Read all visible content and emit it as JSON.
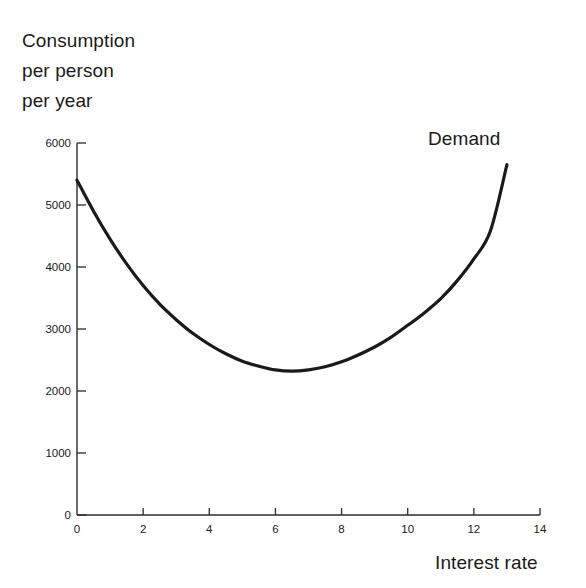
{
  "chart_data": {
    "type": "line",
    "title": "",
    "xlabel": "Interest rate",
    "ylabel": "Consumption per person per year",
    "ylabel_lines": [
      "Consumption",
      "per person",
      "per year"
    ],
    "xlim": [
      0,
      14
    ],
    "ylim": [
      0,
      6000
    ],
    "xticks": [
      0,
      2,
      4,
      6,
      8,
      10,
      12,
      14
    ],
    "xticklabels": [
      "0",
      "2",
      "4",
      "6",
      "8",
      "10",
      "12",
      "14"
    ],
    "yticks": [
      0,
      1000,
      2000,
      3000,
      4000,
      5000,
      6000
    ],
    "yticklabels": [
      "0",
      "1000",
      "2000",
      "3000",
      "4000",
      "5000",
      "6000"
    ],
    "grid": false,
    "legend_position": "inline-right-top",
    "series": [
      {
        "name": "Demand",
        "color": "#1a1a1a",
        "x": [
          0,
          0.5,
          1,
          1.5,
          2,
          2.5,
          3,
          3.5,
          4,
          4.5,
          5,
          5.5,
          6,
          6.5,
          7,
          7.5,
          8,
          8.5,
          9,
          9.5,
          10,
          10.5,
          11,
          11.5,
          12,
          12.5,
          13
        ],
        "y": [
          5400,
          4900,
          4450,
          4050,
          3700,
          3400,
          3150,
          2930,
          2750,
          2600,
          2480,
          2400,
          2340,
          2320,
          2340,
          2390,
          2470,
          2580,
          2710,
          2870,
          3060,
          3260,
          3490,
          3780,
          4130,
          4580,
          5650
        ]
      }
    ],
    "annotations": [
      {
        "text": "Demand",
        "x": 12.1,
        "y": 5850
      }
    ]
  },
  "axis_label_text": {
    "x_axis": "Interest rate",
    "y_axis_line1": "Consumption",
    "y_axis_line2": "per person",
    "y_axis_line3": "per year"
  },
  "colors": {
    "background": "#ffffff",
    "curve": "#1a1a1a",
    "axis": "#2b2b2b",
    "text": "#1a1a1a"
  }
}
